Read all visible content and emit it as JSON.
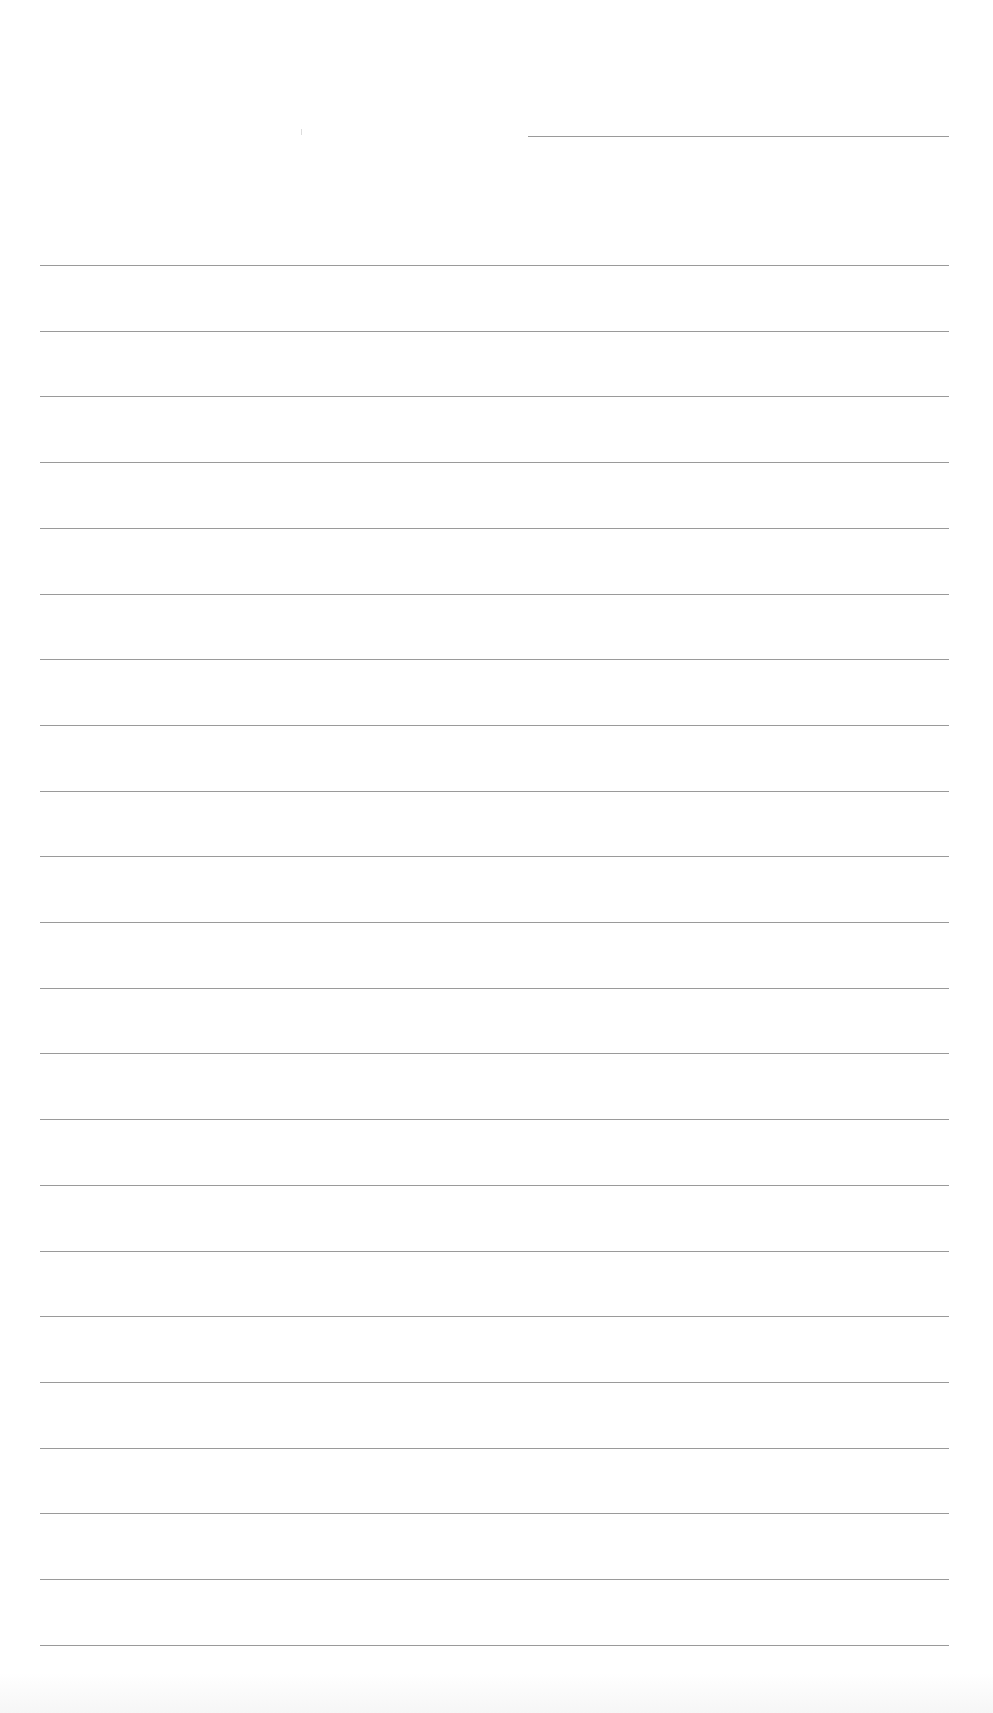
{
  "document": {
    "type": "lined-writing-paper",
    "header_line": {
      "x": 528,
      "y": 136,
      "width": 421
    },
    "rules": {
      "count": 22,
      "first_y": 265,
      "spacing": 65.7,
      "x": 40,
      "width": 909
    },
    "colors": {
      "paper": "#ffffff",
      "rule": "#9a9a9a"
    }
  }
}
